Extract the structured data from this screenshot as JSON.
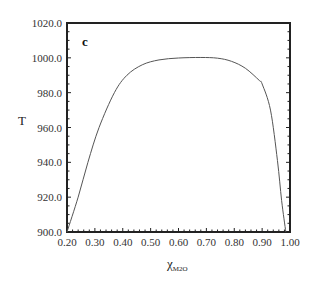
{
  "chart_data": {
    "type": "line",
    "title": "",
    "panel_label": "c",
    "xlabel": "χ",
    "xlabel_subscript": "M2O",
    "ylabel": "T",
    "xlim": [
      0.2,
      1.0
    ],
    "ylim": [
      900.0,
      1020.0
    ],
    "x_ticks": [
      "0.20",
      "0.30",
      "0.40",
      "0.50",
      "0.60",
      "0.70",
      "0.80",
      "0.90",
      "1.00"
    ],
    "y_ticks": [
      "900.0",
      "920.0",
      "940.0",
      "960.0",
      "980.0",
      "1000.0",
      "1020.0"
    ],
    "x_minor_step": 0.02,
    "y_minor_step": 5,
    "grid": false,
    "legend": null,
    "series": [
      {
        "name": "T vs χM2O",
        "color": "#555555",
        "x": [
          0.2,
          0.24,
          0.275,
          0.315,
          0.37,
          0.415,
          0.47,
          0.53,
          0.6,
          0.68,
          0.74,
          0.79,
          0.84,
          0.89,
          0.9,
          0.93,
          0.955,
          0.97,
          0.985
        ],
        "y": [
          900,
          920,
          940,
          960,
          980,
          990,
          996,
          998.8,
          999.9,
          1000.2,
          999.8,
          998,
          994,
          987,
          985,
          970,
          941,
          918,
          900
        ]
      }
    ]
  }
}
